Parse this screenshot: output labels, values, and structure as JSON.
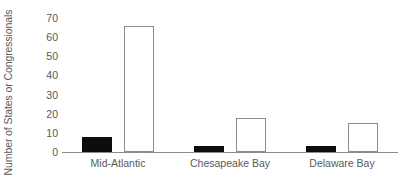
{
  "chart_data": {
    "type": "bar",
    "title": "",
    "xlabel": "",
    "ylabel": "Number of States or Congressionals",
    "categories": [
      "Mid-Atlantic",
      "Chesapeake Bay",
      "Delaware Bay"
    ],
    "series": [
      {
        "name": "series-filled",
        "color": "#0d0d0d",
        "style": "filled",
        "values": [
          8,
          3,
          3
        ]
      },
      {
        "name": "series-hollow",
        "color": "#ffffff",
        "style": "hollow",
        "values": [
          66,
          18,
          15
        ]
      }
    ],
    "ylim": [
      0,
      72
    ],
    "yticks": [
      0,
      10,
      20,
      30,
      40,
      50,
      60,
      70
    ],
    "ytick_labels": [
      "0",
      "10",
      "20",
      "30",
      "40",
      "50",
      "60",
      "70"
    ],
    "grid": false,
    "legend": "none",
    "axis_color": "#8c8c8c",
    "text_color": "#595959",
    "background": "#ffffff"
  }
}
